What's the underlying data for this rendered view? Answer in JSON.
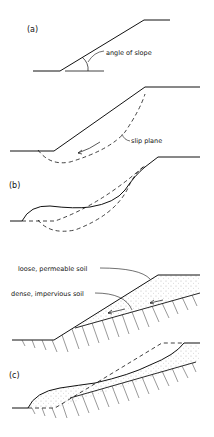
{
  "figure": {
    "panels": [
      {
        "id": "a",
        "label": "(a)",
        "annotations": [
          "angle of slope"
        ]
      },
      {
        "id": "a2",
        "label": "",
        "annotations": [
          "slip plane"
        ]
      },
      {
        "id": "b",
        "label": "(b)",
        "annotations": []
      },
      {
        "id": "b2",
        "label": "",
        "annotations": [
          "loose, permeable soil",
          "dense, impervious soil"
        ]
      },
      {
        "id": "c",
        "label": "(c)",
        "annotations": []
      }
    ]
  }
}
